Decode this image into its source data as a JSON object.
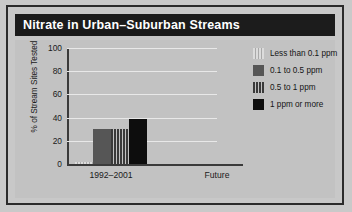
{
  "figure": {
    "title": "Nitrate in Urban–Suburban Streams"
  },
  "chart_data": {
    "type": "bar",
    "title": "Nitrate in Urban–Suburban Streams",
    "xlabel": "",
    "ylabel": "% of Stream Sites Tested",
    "categories": [
      "1992–2001",
      "Future"
    ],
    "ylim": [
      0,
      100
    ],
    "yticks": [
      0,
      20,
      40,
      60,
      80,
      100
    ],
    "grid": true,
    "legend_position": "right",
    "series": [
      {
        "name": "Less than 0.1 ppm",
        "fill": "light-vertical-stripes",
        "color": "#dcdcdc",
        "values": [
          2,
          null
        ]
      },
      {
        "name": "0.1 to 0.5 ppm",
        "fill": "solid-gray",
        "color": "#565656",
        "values": [
          30,
          null
        ]
      },
      {
        "name": "0.5 to 1 ppm",
        "fill": "dark-vertical-stripes",
        "color": "#3a3a3a",
        "values": [
          30,
          null
        ]
      },
      {
        "name": "1 ppm or more",
        "fill": "solid-black",
        "color": "#0d0d0d",
        "values": [
          39,
          null
        ]
      }
    ]
  }
}
